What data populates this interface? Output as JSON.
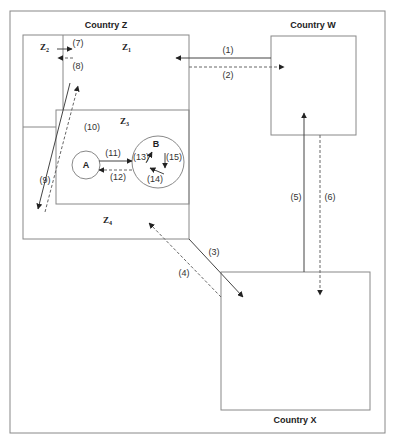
{
  "countries": {
    "Z": {
      "label": "Country Z"
    },
    "W": {
      "label": "Country W"
    },
    "X": {
      "label": "Country X"
    }
  },
  "zones": {
    "Z1": {
      "label": "Z",
      "sub": "1"
    },
    "Z2": {
      "label": "Z",
      "sub": "2"
    },
    "Z3": {
      "label": "Z",
      "sub": "3"
    },
    "Z4": {
      "label": "Z",
      "sub": "4"
    }
  },
  "nodes": {
    "A": {
      "label": "A"
    },
    "B": {
      "label": "B"
    }
  },
  "flows": {
    "f1": {
      "label": "(1)",
      "style": "solid",
      "from": "Country W",
      "to": "Z1"
    },
    "f2": {
      "label": "(2)",
      "style": "dashed",
      "from": "Z1",
      "to": "Country W"
    },
    "f3": {
      "label": "(3)",
      "style": "solid",
      "from": "Country Z",
      "to": "Country X"
    },
    "f4": {
      "label": "(4)",
      "style": "dashed",
      "from": "Country X",
      "to": "Z4"
    },
    "f5": {
      "label": "(5)",
      "style": "solid",
      "from": "Country X",
      "to": "Country W"
    },
    "f6": {
      "label": "(6)",
      "style": "dashed",
      "from": "Country W",
      "to": "Country X"
    },
    "f7": {
      "label": "(7)",
      "style": "solid",
      "from": "Z2",
      "to": "Z1"
    },
    "f8": {
      "label": "(8)",
      "style": "dashed",
      "from": "Z1",
      "to": "Z2"
    },
    "f9": {
      "label": "(9)",
      "style": "solid",
      "from": "Z1",
      "to": "Z4"
    },
    "f10": {
      "label": "(10)",
      "style": "dashed",
      "from": "Z4",
      "to": "Z1"
    },
    "f11": {
      "label": "(11)",
      "style": "solid",
      "from": "A",
      "to": "B"
    },
    "f12": {
      "label": "(12)",
      "style": "dashed",
      "from": "B",
      "to": "A"
    },
    "f13": {
      "label": "(13)",
      "style": "solid",
      "from": "B",
      "to": "B"
    },
    "f14": {
      "label": "(14)",
      "style": "solid",
      "from": "B",
      "to": "B"
    },
    "f15": {
      "label": "(15)",
      "style": "solid",
      "from": "B",
      "to": "B"
    }
  },
  "colors": {
    "line": "#444444",
    "box": "#888888",
    "text": "#222222"
  }
}
